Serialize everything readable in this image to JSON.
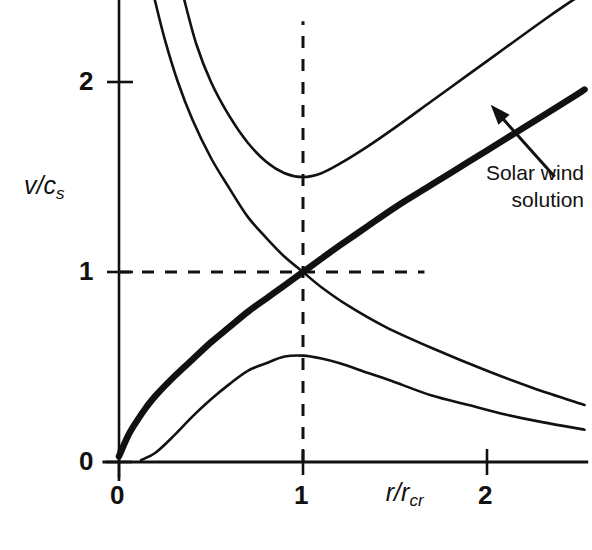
{
  "figure": {
    "background": "#ffffff",
    "ink_color": "#111111"
  },
  "axes": {
    "y_title": "v/c",
    "y_title_sub": "s",
    "x_title": "r/r",
    "x_title_sub": "cr",
    "y_ticks": [
      {
        "value": 0,
        "label": "0"
      },
      {
        "value": 1,
        "label": "1"
      },
      {
        "value": 2,
        "label": "2"
      }
    ],
    "x_ticks": [
      {
        "value": 0,
        "label": "0"
      },
      {
        "value": 1,
        "label": "1"
      },
      {
        "value": 2,
        "label": "2"
      }
    ],
    "xlim": [
      -0.09,
      2.55
    ],
    "ylim": [
      -0.04,
      2.45
    ]
  },
  "annotation": {
    "line1": "Solar wind",
    "line2": "solution",
    "target_x": 2.02,
    "target_y": 1.88
  },
  "chart_data": {
    "type": "line",
    "title": "",
    "xlabel": "r/r_cr",
    "ylabel": "v/c_s",
    "xlim": [
      -0.09,
      2.55
    ],
    "ylim": [
      -0.04,
      2.45
    ],
    "grid": false,
    "legend": "none",
    "critical_point": {
      "x": 1,
      "y": 1
    },
    "guides": [
      {
        "name": "vertical-critical-line",
        "style": "dashed",
        "x": 1,
        "y_from": 0,
        "y_to": 2.32
      },
      {
        "name": "horizontal-critical-line",
        "style": "dashed",
        "y": 1,
        "x_from": 0,
        "x_to": 1.66
      }
    ],
    "series": [
      {
        "name": "solar-wind-solution",
        "style": "solid-thick",
        "description": "Transonic accelerating wind solution passing through the critical point (1,1)",
        "points": [
          [
            0.0,
            0.03
          ],
          [
            0.05,
            0.14
          ],
          [
            0.1,
            0.22
          ],
          [
            0.15,
            0.29
          ],
          [
            0.2,
            0.35
          ],
          [
            0.3,
            0.45
          ],
          [
            0.4,
            0.54
          ],
          [
            0.5,
            0.63
          ],
          [
            0.6,
            0.71
          ],
          [
            0.7,
            0.79
          ],
          [
            0.8,
            0.86
          ],
          [
            0.9,
            0.93
          ],
          [
            1.0,
            1.0
          ],
          [
            1.1,
            1.07
          ],
          [
            1.2,
            1.14
          ],
          [
            1.35,
            1.24
          ],
          [
            1.5,
            1.34
          ],
          [
            1.7,
            1.46
          ],
          [
            1.9,
            1.58
          ],
          [
            2.1,
            1.7
          ],
          [
            2.3,
            1.82
          ],
          [
            2.45,
            1.91
          ],
          [
            2.53,
            1.96
          ]
        ]
      },
      {
        "name": "accretion-solution",
        "style": "solid-thin",
        "description": "Transonic decelerating (accretion) solution through the critical point (1,1)",
        "points": [
          [
            0.19,
            2.45
          ],
          [
            0.25,
            2.22
          ],
          [
            0.32,
            2.0
          ],
          [
            0.4,
            1.8
          ],
          [
            0.5,
            1.6
          ],
          [
            0.6,
            1.44
          ],
          [
            0.7,
            1.29
          ],
          [
            0.8,
            1.18
          ],
          [
            0.9,
            1.08
          ],
          [
            1.0,
            1.0
          ],
          [
            1.1,
            0.92
          ],
          [
            1.25,
            0.82
          ],
          [
            1.45,
            0.71
          ],
          [
            1.7,
            0.6
          ],
          [
            2.0,
            0.48
          ],
          [
            2.25,
            0.39
          ],
          [
            2.53,
            0.3
          ]
        ]
      },
      {
        "name": "supersonic-branch",
        "style": "solid-thin",
        "description": "Double-valued supersonic branch with minimum near (1, 1.50)",
        "points": [
          [
            0.35,
            2.45
          ],
          [
            0.42,
            2.2
          ],
          [
            0.5,
            2.0
          ],
          [
            0.6,
            1.82
          ],
          [
            0.7,
            1.68
          ],
          [
            0.8,
            1.58
          ],
          [
            0.9,
            1.52
          ],
          [
            1.0,
            1.5
          ],
          [
            1.1,
            1.52
          ],
          [
            1.2,
            1.57
          ],
          [
            1.35,
            1.66
          ],
          [
            1.5,
            1.76
          ],
          [
            1.7,
            1.9
          ],
          [
            1.9,
            2.04
          ],
          [
            2.1,
            2.18
          ],
          [
            2.3,
            2.32
          ],
          [
            2.45,
            2.42
          ],
          [
            2.5,
            2.45
          ]
        ]
      },
      {
        "name": "subsonic-breeze-branch",
        "style": "solid-thin",
        "description": "Double-valued subsonic breeze branch with maximum near (1, 0.56)",
        "points": [
          [
            0.12,
            0.01
          ],
          [
            0.2,
            0.05
          ],
          [
            0.3,
            0.14
          ],
          [
            0.4,
            0.24
          ],
          [
            0.5,
            0.33
          ],
          [
            0.6,
            0.41
          ],
          [
            0.7,
            0.48
          ],
          [
            0.8,
            0.52
          ],
          [
            0.9,
            0.555
          ],
          [
            1.0,
            0.56
          ],
          [
            1.1,
            0.545
          ],
          [
            1.2,
            0.52
          ],
          [
            1.35,
            0.47
          ],
          [
            1.5,
            0.42
          ],
          [
            1.7,
            0.35
          ],
          [
            1.9,
            0.3
          ],
          [
            2.1,
            0.25
          ],
          [
            2.3,
            0.21
          ],
          [
            2.53,
            0.17
          ]
        ]
      }
    ]
  }
}
